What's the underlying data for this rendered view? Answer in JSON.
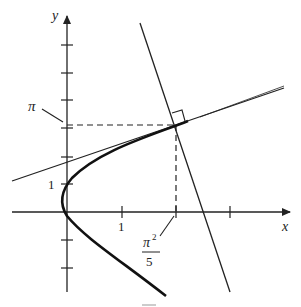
{
  "diagram": {
    "type": "graph",
    "axes": {
      "x_label": "x",
      "y_label": "y"
    },
    "x_ticks": [
      {
        "label": "1"
      },
      {
        "label_num": "π",
        "label_exp": "2",
        "label_den": "5"
      }
    ],
    "y_ticks": [
      {
        "label": "1"
      },
      {
        "label": "π"
      }
    ],
    "curves": [
      {
        "name": "parabola",
        "kind": "curve"
      },
      {
        "name": "tangent-line",
        "kind": "line"
      },
      {
        "name": "normal-line",
        "kind": "line"
      }
    ],
    "annotations": [
      "right-angle-marker",
      "dashed-guides"
    ],
    "colors": {
      "ink": "#222222",
      "background": "#ffffff"
    }
  }
}
